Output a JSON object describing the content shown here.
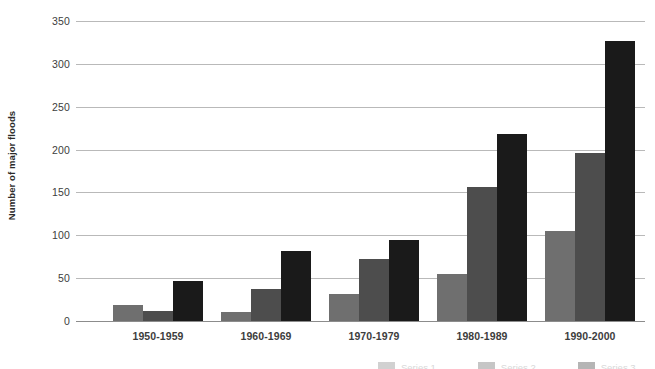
{
  "chart_data": {
    "type": "bar",
    "title": "",
    "xlabel": "",
    "ylabel": "Number of major floods",
    "categories": [
      "1950-1959",
      "1960-1969",
      "1970-1979",
      "1980-1989",
      "1990-2000"
    ],
    "series": [
      {
        "name": "Series 1",
        "color": "#6f6f6f",
        "values": [
          19,
          11,
          31,
          55,
          105
        ]
      },
      {
        "name": "Series 2",
        "color": "#4d4d4d",
        "values": [
          12,
          37,
          72,
          156,
          196
        ]
      },
      {
        "name": "Series 3",
        "color": "#1a1a1a",
        "values": [
          47,
          82,
          94,
          218,
          327
        ]
      }
    ],
    "ylim": [
      0,
      350
    ],
    "yticks": [
      0,
      50,
      100,
      150,
      200,
      250,
      300,
      350
    ],
    "ytick_labels": [
      "0",
      "50",
      "100",
      "150",
      "200",
      "250",
      "300",
      "350"
    ],
    "grid": true,
    "legend_position": "bottom-right"
  },
  "axis": {
    "gridline_color": "#b9b9b9",
    "baseline_color": "#8c8c8c",
    "label_color": "#3d3d3d"
  }
}
